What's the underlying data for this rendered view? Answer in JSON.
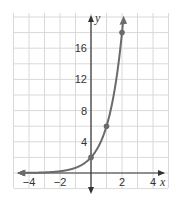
{
  "chart_data": {
    "type": "line",
    "title": "",
    "xlabel": "x",
    "ylabel": "y",
    "xlim": [
      -5,
      5
    ],
    "ylim": [
      -2,
      20
    ],
    "grid": true,
    "x_ticks": [
      -4,
      -2,
      2,
      4
    ],
    "y_ticks": [
      4,
      8,
      12,
      16
    ],
    "x_tick_labels": [
      "−4",
      "−2",
      "2",
      "4"
    ],
    "y_tick_labels": [
      "4",
      "8",
      "12",
      "16"
    ],
    "series": [
      {
        "name": "y = 2(3)^x",
        "function": "2*3^x",
        "marked_points": [
          {
            "x": 0,
            "y": 2
          },
          {
            "x": 1,
            "y": 6
          },
          {
            "x": 2,
            "y": 18
          }
        ],
        "color": "#6b6b6b"
      }
    ],
    "legend": null
  },
  "labels": {
    "x_axis": "x",
    "y_axis": "y"
  }
}
